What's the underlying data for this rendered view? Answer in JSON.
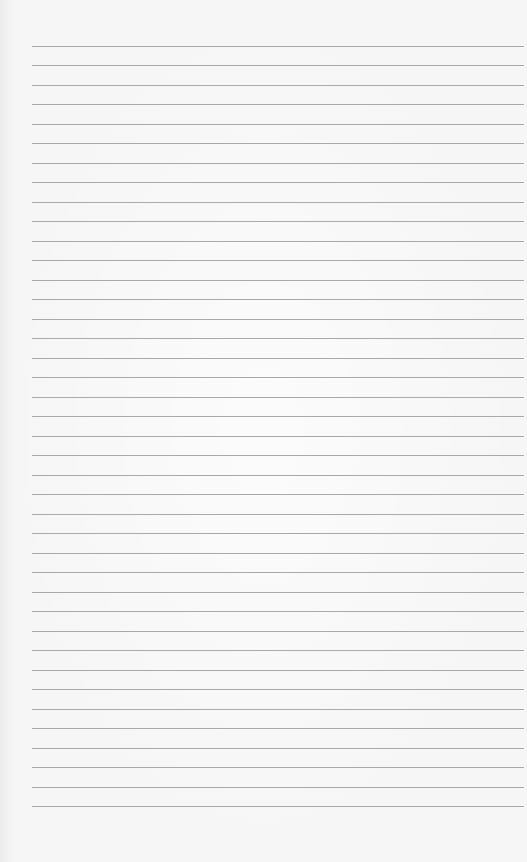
{
  "paper": {
    "type": "lined-paper",
    "background_color": "#f6f6f6",
    "line_color": "#a9a9a9",
    "line_count": 40,
    "first_line_y": 46,
    "line_spacing": 19.49,
    "line_left_x": 32,
    "line_right_x": 524
  }
}
